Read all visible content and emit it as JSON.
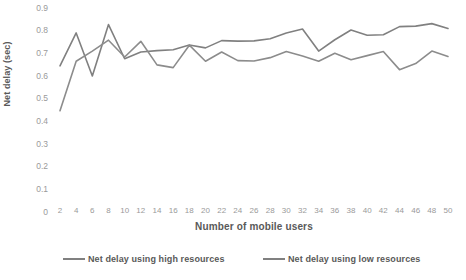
{
  "chart_data": {
    "type": "line",
    "title": "",
    "xlabel": "Number of mobile users",
    "ylabel": "Net delay (sec)",
    "xlim": [
      2,
      50
    ],
    "ylim": [
      0,
      0.9
    ],
    "grid": false,
    "legend_position": "bottom",
    "x": [
      2,
      4,
      6,
      8,
      10,
      12,
      14,
      16,
      18,
      20,
      22,
      24,
      26,
      28,
      30,
      32,
      34,
      36,
      38,
      40,
      42,
      44,
      46,
      48,
      50
    ],
    "categories": [
      "2",
      "4",
      "6",
      "8",
      "10",
      "12",
      "14",
      "16",
      "18",
      "20",
      "22",
      "24",
      "26",
      "28",
      "30",
      "32",
      "34",
      "36",
      "38",
      "40",
      "42",
      "44",
      "46",
      "48",
      "50"
    ],
    "ytick_labels": [
      "0.9",
      "0.8",
      "0.7",
      "0.6",
      "0.5",
      "0.4",
      "0.3",
      "0.2",
      "0.1",
      "0"
    ],
    "ytick_values": [
      0.9,
      0.8,
      0.7,
      0.6,
      0.5,
      0.4,
      0.3,
      0.2,
      0.1,
      0
    ],
    "series": [
      {
        "name": "Net delay using high resources",
        "color": "#808080",
        "values": [
          0.645,
          0.79,
          0.6,
          0.827,
          0.676,
          0.706,
          0.712,
          0.716,
          0.737,
          0.724,
          0.756,
          0.754,
          0.755,
          0.764,
          0.79,
          0.807,
          0.71,
          0.76,
          0.803,
          0.78,
          0.782,
          0.818,
          0.82,
          0.831,
          0.81
        ]
      },
      {
        "name": "Net delay using low resources",
        "color": "#8c8c8c",
        "values": [
          0.447,
          0.665,
          0.71,
          0.758,
          0.684,
          0.753,
          0.649,
          0.637,
          0.736,
          0.665,
          0.706,
          0.668,
          0.666,
          0.681,
          0.708,
          0.688,
          0.665,
          0.7,
          0.672,
          0.69,
          0.708,
          0.628,
          0.655,
          0.71,
          0.686
        ]
      }
    ]
  },
  "legend": {
    "items": [
      {
        "label": "Net delay using high resources"
      },
      {
        "label": "Net delay using low resources"
      }
    ]
  }
}
